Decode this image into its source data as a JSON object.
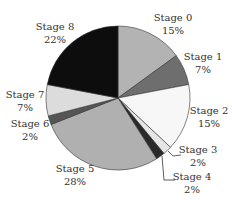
{
  "chart_data": {
    "type": "pie",
    "title": "",
    "start_angle_deg": 0,
    "direction": "clockwise",
    "slices": [
      {
        "label": "Stage 0",
        "pct_label": "15%",
        "value": 15,
        "color": "#b3b3b3"
      },
      {
        "label": "Stage 1",
        "pct_label": "7%",
        "value": 7,
        "color": "#6e6e6e"
      },
      {
        "label": "Stage 2",
        "pct_label": "15%",
        "value": 15,
        "color": "#f7f7f7"
      },
      {
        "label": "Stage 3",
        "pct_label": "2%",
        "value": 2,
        "color": "#e6e6e6"
      },
      {
        "label": "Stage 4",
        "pct_label": "2%",
        "value": 2,
        "color": "#2a2a2a"
      },
      {
        "label": "Stage 5",
        "pct_label": "28%",
        "value": 28,
        "color": "#b0b0b0"
      },
      {
        "label": "Stage 6",
        "pct_label": "2%",
        "value": 2,
        "color": "#555555"
      },
      {
        "label": "Stage 7",
        "pct_label": "7%",
        "value": 7,
        "color": "#dcdcdc"
      },
      {
        "label": "Stage 8",
        "pct_label": "22%",
        "value": 22,
        "color": "#0d0d0d"
      }
    ],
    "legend": "none (direct labels)"
  },
  "labels": [
    {
      "name": "Stage 0",
      "pct": "15%",
      "x": 173,
      "y": 25
    },
    {
      "name": "Stage 1",
      "pct": "7%",
      "x": 203,
      "y": 64
    },
    {
      "name": "Stage 2",
      "pct": "15%",
      "x": 209,
      "y": 118
    },
    {
      "name": "Stage 3",
      "pct": "2%",
      "x": 198,
      "y": 157
    },
    {
      "name": "Stage 4",
      "pct": "2%",
      "x": 192,
      "y": 184
    },
    {
      "name": "Stage 5",
      "pct": "28%",
      "x": 75,
      "y": 176
    },
    {
      "name": "Stage 6",
      "pct": "2%",
      "x": 30,
      "y": 131
    },
    {
      "name": "Stage 7",
      "pct": "7%",
      "x": 25,
      "y": 102
    },
    {
      "name": "Stage 8",
      "pct": "22%",
      "x": 55,
      "y": 34
    }
  ]
}
